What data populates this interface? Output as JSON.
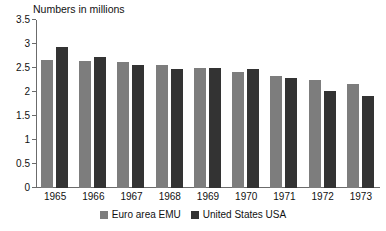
{
  "chart_data": {
    "type": "bar",
    "title": "Numbers in millions",
    "xlabel": "",
    "ylabel": "",
    "ylim": [
      0,
      3.5
    ],
    "yticks": [
      "0",
      "0.5",
      "1",
      "1.5",
      "2",
      "2.5",
      "3",
      "3.5"
    ],
    "ytick_values": [
      0,
      0.5,
      1,
      1.5,
      2,
      2.5,
      3,
      3.5
    ],
    "grid": false,
    "legend_position": "bottom-center",
    "categories": [
      "1965",
      "1966",
      "1967",
      "1968",
      "1969",
      "1970",
      "1971",
      "1972",
      "1973"
    ],
    "series": [
      {
        "name": "Euro area EMU",
        "color": "#7d7d7d",
        "values": [
          2.67,
          2.65,
          2.62,
          2.56,
          2.5,
          2.42,
          2.33,
          2.25,
          2.16
        ]
      },
      {
        "name": "United States USA",
        "color": "#333333",
        "values": [
          2.93,
          2.72,
          2.57,
          2.48,
          2.51,
          2.47,
          2.29,
          2.03,
          1.91
        ]
      }
    ]
  },
  "legend": {
    "items": [
      {
        "label": "Euro area EMU",
        "color": "#7d7d7d"
      },
      {
        "label": "United States USA",
        "color": "#333333"
      }
    ]
  }
}
